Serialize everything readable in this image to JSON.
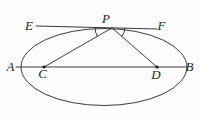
{
  "figure": {
    "figure_type": "ellipse-tangent-geometry-diagram",
    "labels": {
      "E": "E",
      "P": "P",
      "F": "F",
      "A": "A",
      "B": "B",
      "C": "C",
      "D": "D"
    },
    "colors": {
      "stroke": "#3a3a3a",
      "text": "#1e1e1e",
      "background": "#fdfdfd"
    },
    "geometry": {
      "canvas": {
        "width": 202,
        "height": 122
      },
      "ellipse": {
        "cx": 104,
        "cy": 67,
        "rx": 83,
        "ry": 38.5
      },
      "major_axis": {
        "x1": 16,
        "y1": 67,
        "x2": 186,
        "y2": 67
      },
      "tangent": {
        "x1": 36,
        "y1": 26,
        "x2": 157,
        "y2": 29
      },
      "focal_pc": {
        "x1": 112,
        "y1": 27.9,
        "x2": 44,
        "y2": 67
      },
      "focal_pd": {
        "x1": 112,
        "y1": 27.9,
        "x2": 157,
        "y2": 67
      },
      "angle_arc_left": {
        "d": "M 95 27.5 A 17 17 0 0 0 97.3 36.4"
      },
      "angle_arc_right": {
        "d": "M 125 28.2 A 13 13 0 0 1 121.8 36.4"
      },
      "focus_c": {
        "cx": 44,
        "cy": 67,
        "r": 1.6
      },
      "focus_d": {
        "cx": 157,
        "cy": 67,
        "r": 1.6
      },
      "label_pos": {
        "E": {
          "x": 29,
          "y": 30
        },
        "P": {
          "x": 106,
          "y": 23
        },
        "F": {
          "x": 161.5,
          "y": 29.5
        },
        "A": {
          "x": 10.5,
          "y": 71
        },
        "B": {
          "x": 189.5,
          "y": 70.5
        },
        "C": {
          "x": 42.5,
          "y": 78
        },
        "D": {
          "x": 156,
          "y": 78.5
        }
      }
    }
  }
}
